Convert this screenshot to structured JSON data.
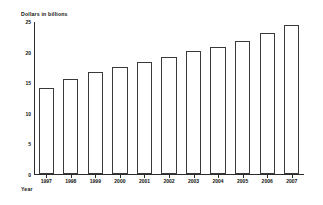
{
  "chart_data": {
    "type": "bar",
    "title": "",
    "subtitle": "",
    "ylabel": "Dollars in billions",
    "xlabel": "Year",
    "categories": [
      "1997",
      "1998",
      "1999",
      "2000",
      "2001",
      "2002",
      "2003",
      "2004",
      "2005",
      "2006",
      "2007"
    ],
    "values": [
      14.0,
      15.6,
      16.6,
      17.5,
      18.3,
      19.1,
      20.1,
      20.7,
      21.7,
      23.0,
      24.4
    ],
    "ylim": [
      0,
      25
    ],
    "yticks": [
      0,
      5,
      10,
      15,
      20,
      25
    ],
    "ytick_labels": [
      "0",
      "5",
      "10",
      "15",
      "20",
      "25"
    ],
    "grid": false,
    "legend": null,
    "legend_position": "none",
    "bar_fill_color": "#ffffff",
    "bar_edge_color": "#3a3a3a",
    "axis_color": "#2a2a2a",
    "annotations": []
  }
}
